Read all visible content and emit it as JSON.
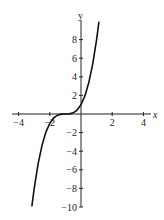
{
  "chart_data": {
    "type": "line",
    "title": "",
    "xlabel": "x",
    "ylabel": "y",
    "xlim": [
      -4.3,
      4.3
    ],
    "ylim": [
      -10,
      10
    ],
    "x_ticks": [
      -4,
      -2,
      2,
      4
    ],
    "x_tick_labels": [
      "−4",
      "−2",
      "2",
      "4"
    ],
    "y_ticks": [
      -10,
      -8,
      -6,
      -4,
      -2,
      2,
      4,
      6,
      8
    ],
    "y_tick_labels": [
      "−10",
      "−8",
      "−6",
      "−4",
      "−2",
      "2",
      "4",
      "6",
      "8"
    ],
    "grid": false,
    "legend": null,
    "series": [
      {
        "name": "f(x) = (x+1)^3",
        "x": [
          -3.15,
          -3.0,
          -2.75,
          -2.5,
          -2.25,
          -2.0,
          -1.75,
          -1.5,
          -1.25,
          -1.0,
          -0.75,
          -0.5,
          -0.25,
          0.0,
          0.25,
          0.5,
          0.75,
          1.0,
          1.15
        ],
        "y": [
          -9.94,
          -8.0,
          -5.36,
          -3.38,
          -1.95,
          -1.0,
          -0.42,
          -0.125,
          -0.016,
          0.0,
          0.016,
          0.125,
          0.42,
          1.0,
          1.95,
          3.38,
          5.36,
          8.0,
          9.94
        ]
      }
    ],
    "color": "#111111"
  }
}
